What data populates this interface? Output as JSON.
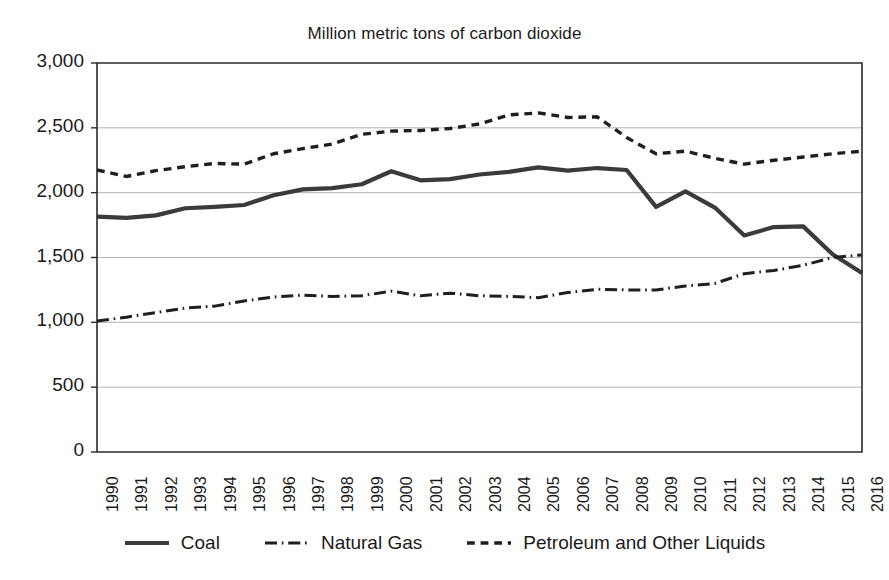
{
  "chart_data": {
    "type": "line",
    "title": "Million metric tons of carbon dioxide",
    "xlabel": "",
    "ylabel": "",
    "ylim": [
      0,
      3000
    ],
    "ytick_values": [
      3000,
      2500,
      2000,
      1500,
      1000,
      500,
      0
    ],
    "ytick_labels": [
      "3,000",
      "2,500",
      "2,000",
      "1,500",
      "1,000",
      "500",
      "0"
    ],
    "grid": true,
    "legend_position": "bottom",
    "categories": [
      1990,
      1991,
      1992,
      1993,
      1994,
      1995,
      1996,
      1997,
      1998,
      1999,
      2000,
      2001,
      2002,
      2003,
      2004,
      2005,
      2006,
      2007,
      2008,
      2009,
      2010,
      2011,
      2012,
      2013,
      2014,
      2015,
      2016
    ],
    "xtick_labels": [
      "1990",
      "1991",
      "1992",
      "1993",
      "1994",
      "1995",
      "1996",
      "1997",
      "1998",
      "1999",
      "2000",
      "2001",
      "2002",
      "2003",
      "2004",
      "2005",
      "2006",
      "2007",
      "2008",
      "2009",
      "2010",
      "2011",
      "2012",
      "2013",
      "2014",
      "2015",
      "2016"
    ],
    "series": [
      {
        "name": "Coal",
        "style": "solid",
        "color": "#3b3b3b",
        "width": 4.2,
        "values": [
          1815,
          1805,
          1825,
          1880,
          1890,
          1905,
          1980,
          2025,
          2035,
          2065,
          2165,
          2095,
          2105,
          2140,
          2160,
          2195,
          2170,
          2190,
          2175,
          1890,
          2010,
          1885,
          1670,
          1735,
          1740,
          1525,
          1380
        ]
      },
      {
        "name": "Natural Gas",
        "style": "dashdot",
        "color": "#1f1f1f",
        "width": 3.0,
        "values": [
          1010,
          1040,
          1075,
          1110,
          1125,
          1165,
          1195,
          1210,
          1200,
          1205,
          1240,
          1205,
          1225,
          1205,
          1200,
          1190,
          1230,
          1255,
          1250,
          1250,
          1280,
          1300,
          1375,
          1400,
          1440,
          1500,
          1520
        ]
      },
      {
        "name": "Petroleum and Other Liquids",
        "style": "dashed",
        "color": "#1f1f1f",
        "width": 3.4,
        "values": [
          2175,
          2125,
          2170,
          2200,
          2225,
          2220,
          2300,
          2340,
          2375,
          2450,
          2475,
          2480,
          2495,
          2530,
          2600,
          2615,
          2580,
          2585,
          2425,
          2300,
          2320,
          2265,
          2220,
          2250,
          2275,
          2300,
          2320
        ]
      }
    ]
  },
  "legend": {
    "items": [
      {
        "label": "Coal",
        "swatch": "solid-line-swatch"
      },
      {
        "label": "Natural Gas",
        "swatch": "dashdot-line-swatch"
      },
      {
        "label": "Petroleum and Other Liquids",
        "swatch": "dashed-line-swatch"
      }
    ]
  },
  "colors": {
    "axis": "#2b2b2b",
    "grid": "#b4b4b4",
    "text": "#1a1a1a",
    "background": "#ffffff"
  }
}
